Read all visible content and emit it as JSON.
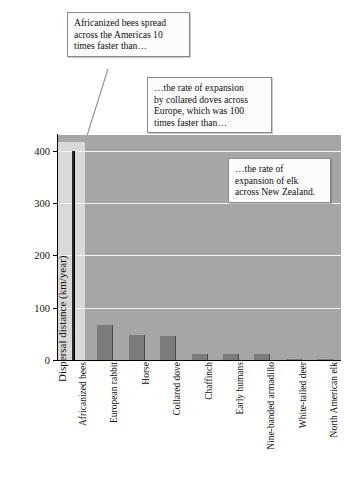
{
  "chart_data": {
    "type": "bar",
    "title": "",
    "xlabel": "",
    "ylabel": "Dispersal distance (km/year)",
    "ylim": [
      0,
      430
    ],
    "yticks": [
      0,
      100,
      200,
      300,
      400
    ],
    "ytick_labels": [
      "0",
      "100",
      "200",
      "300",
      "400"
    ],
    "grid": true,
    "legend": "none",
    "categories": [
      "Africanized bees",
      "European rabbit",
      "Horse",
      "Collared dove",
      "Chaffinch",
      "Early humans",
      "Nine-banded armadillo",
      "White-tailed deer",
      "North American elk"
    ],
    "values": [
      400,
      67,
      48,
      45,
      11,
      11,
      12,
      2,
      1.5
    ],
    "annotations": [
      "Africanized bees spread across the Americas 10 times faster than…",
      "…the rate of expansion by collared doves across Europe, which was 100 times faster than…",
      "…the rate of expansion of elk across New Zealand."
    ]
  },
  "axis": {
    "y_title": "Dispersal distance (km/year)",
    "ticks": [
      {
        "label": "400",
        "value": 400
      },
      {
        "label": "300",
        "value": 300
      },
      {
        "label": "200",
        "value": 200
      },
      {
        "label": "100",
        "value": 100
      },
      {
        "label": "0",
        "value": 0
      }
    ]
  },
  "categories": [
    {
      "label": "Africanized bees",
      "value": 400
    },
    {
      "label": "European rabbit",
      "value": 67
    },
    {
      "label": "Horse",
      "value": 48
    },
    {
      "label": "Collared dove",
      "value": 45
    },
    {
      "label": "Chaffinch",
      "value": 11
    },
    {
      "label": "Early humans",
      "value": 11
    },
    {
      "label": "Nine-banded armadillo",
      "value": 12
    },
    {
      "label": "White-tailed deer",
      "value": 2
    },
    {
      "label": "North American elk",
      "value": 1.5
    }
  ],
  "callouts": [
    {
      "id": "callout-bees",
      "line1": "Africanized bees spread",
      "line2": "across the Americas 10",
      "line3": "times faster than…",
      "line4": ""
    },
    {
      "id": "callout-collared-dove",
      "line1": "…the rate of expansion",
      "line2": "by collared doves across",
      "line3": "Europe, which was 100",
      "line4": "times faster than…"
    },
    {
      "id": "callout-elk",
      "line1": "…the rate of",
      "line2": "expansion of elk",
      "line3": "across New Zealand.",
      "line4": ""
    }
  ],
  "colors": {
    "plot_background": "#a6a6a6",
    "first_band": "#d9d9d9",
    "bar": "#7b7b7b",
    "bees_bar": "#2b2b2b",
    "gridline": "#f2f2f2",
    "axis": "#000000",
    "callout_background": "#fbfbfb",
    "callout_border": "#8a8a8a",
    "page_background": "#ffffff"
  }
}
